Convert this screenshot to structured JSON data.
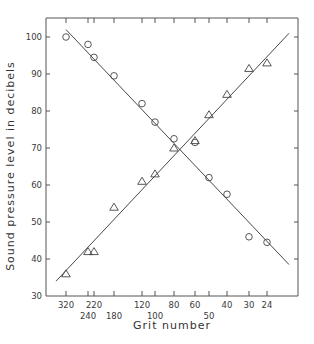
{
  "chart_data": {
    "type": "scatter",
    "title": "",
    "xlabel": "Grit number",
    "ylabel": "Sound pressure level in decibels",
    "ylim": [
      30,
      100
    ],
    "yticks": [
      30,
      40,
      50,
      60,
      70,
      80,
      90,
      100
    ],
    "grid": false,
    "legend": "none",
    "categories": [
      "320",
      "240",
      "220",
      "180",
      "120",
      "100",
      "80",
      "60",
      "50",
      "40",
      "30",
      "24"
    ],
    "x_tick_rows": {
      "upper": [
        "320",
        "220",
        "120",
        "80",
        "60",
        "40",
        "30",
        "24"
      ],
      "lower": [
        "240",
        "180",
        "100",
        "50"
      ]
    },
    "series": [
      {
        "name": "circles (decreasing)",
        "marker": "circle",
        "values": [
          100,
          98,
          94.5,
          89.5,
          82,
          77,
          72.5,
          71.5,
          62,
          57.5,
          46,
          44.5
        ],
        "fit_line": {
          "start": [
            "320",
            102
          ],
          "end": [
            "beyond 24",
            38.5
          ]
        }
      },
      {
        "name": "triangles (increasing)",
        "marker": "triangle",
        "values": [
          36,
          42,
          42,
          54,
          61,
          63,
          70,
          72,
          79,
          84.5,
          91.5,
          93
        ],
        "fit_line": {
          "start": [
            "beyond 320",
            34
          ],
          "end": [
            "beyond 24",
            101
          ]
        }
      }
    ],
    "annotations": [
      "Lines intersect near 80 grit at about 69.5 dB"
    ]
  }
}
